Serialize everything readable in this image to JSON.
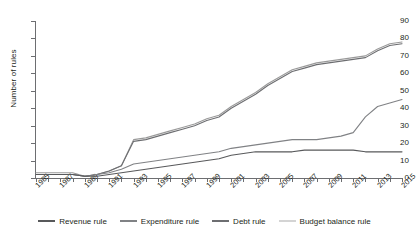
{
  "chart_data": {
    "type": "line",
    "title": "",
    "xlabel": "",
    "ylabel": "Number of rules",
    "ylim": [
      0,
      90
    ],
    "ytick_step": 10,
    "xlim": [
      1985,
      2015
    ],
    "grid": false,
    "legend_position": "bottom",
    "x": [
      1985,
      1986,
      1987,
      1988,
      1989,
      1990,
      1991,
      1992,
      1993,
      1994,
      1995,
      1996,
      1997,
      1998,
      1999,
      2000,
      2001,
      2002,
      2003,
      2004,
      2005,
      2006,
      2007,
      2008,
      2009,
      2010,
      2011,
      2012,
      2013,
      2014,
      2015
    ],
    "series": [
      {
        "name": "Budget balance rule",
        "color": "#9a9a9a",
        "values": [
          3,
          3,
          3,
          3,
          1,
          2,
          4,
          7,
          22,
          23,
          25,
          27,
          29,
          31,
          34,
          36,
          41,
          45,
          49,
          54,
          58,
          62,
          64,
          66,
          67,
          68,
          69,
          70,
          74,
          77,
          78
        ]
      },
      {
        "name": "Debt rule",
        "color": "#6d6e71",
        "values": [
          2,
          2,
          2,
          2,
          1,
          2,
          4,
          7,
          21,
          22,
          24,
          26,
          28,
          30,
          33,
          35,
          40,
          44,
          48,
          53,
          57,
          61,
          63,
          65,
          66,
          67,
          68,
          69,
          73,
          76,
          77
        ]
      },
      {
        "name": "Expenditure rule",
        "color": "#808285",
        "values": [
          2,
          2,
          2,
          2,
          1,
          2,
          3,
          5,
          8,
          9,
          10,
          11,
          12,
          13,
          14,
          15,
          17,
          18,
          19,
          20,
          21,
          22,
          22,
          22,
          23,
          24,
          26,
          35,
          41,
          43,
          45
        ]
      },
      {
        "name": "Revenue rule",
        "color": "#58595b",
        "values": [
          2,
          2,
          2,
          2,
          1,
          1,
          2,
          3,
          4,
          5,
          6,
          7,
          8,
          9,
          10,
          11,
          13,
          14,
          15,
          15,
          15,
          15,
          16,
          16,
          16,
          16,
          16,
          15,
          15,
          15,
          15
        ]
      }
    ],
    "ytick_labels": [
      "0",
      "10",
      "20",
      "30",
      "40",
      "50",
      "60",
      "70",
      "80",
      "90"
    ],
    "xtick_labels": [
      "1985",
      "1987",
      "1989",
      "1991",
      "1993",
      "1995",
      "1997",
      "1999",
      "2001",
      "2003",
      "2005",
      "2007",
      "2009",
      "2011",
      "2013",
      "2015"
    ]
  },
  "legend": {
    "items": [
      {
        "label": "Revenue rule",
        "color": "#58595b"
      },
      {
        "label": "Expenditure rule",
        "color": "#808285"
      },
      {
        "label": "Debt rule",
        "color": "#6d6e71"
      },
      {
        "label": "Budget balance rule",
        "color": "#d4d4d4"
      }
    ]
  }
}
